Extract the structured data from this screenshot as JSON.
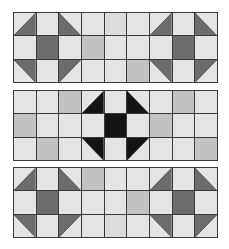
{
  "figure": {
    "colors": {
      "light": "#e4e4e4",
      "light_alt": "#dcdcdc",
      "medium": "#c2c2c2",
      "dark_gray": "#6c6c6c",
      "black": "#141414",
      "grid_line": "#3a3a3a"
    },
    "legend_codes": {
      "L": "light square",
      "A": "light square (alt tone)",
      "M": "medium gray square",
      "D": "solid dark fill",
      "TL": "half-square triangle, dark toward bottom-right",
      "TR": "half-square triangle, dark toward bottom-left",
      "BL": "half-square triangle, dark toward top-right",
      "BR": "half-square triangle, dark toward top-left"
    },
    "panels": [
      {
        "name": "panel-top",
        "top": 12,
        "dark": "#6c6c6c",
        "rows": [
          [
            "TL",
            "L",
            "TR",
            "L",
            "A",
            "L",
            "TL",
            "L",
            "TR"
          ],
          [
            "L",
            "D",
            "L",
            "M",
            "L",
            "L",
            "L",
            "D",
            "L"
          ],
          [
            "BL",
            "L",
            "BR",
            "L",
            "L",
            "M",
            "BL",
            "L",
            "BR"
          ]
        ]
      },
      {
        "name": "panel-middle",
        "top": 90,
        "dark": "#141414",
        "rows": [
          [
            "L",
            "L",
            "M",
            "TL",
            "L",
            "TR",
            "L",
            "M",
            "L"
          ],
          [
            "M",
            "L",
            "L",
            "L",
            "D",
            "L",
            "M",
            "L",
            "L"
          ],
          [
            "L",
            "M",
            "L",
            "BL",
            "L",
            "BR",
            "L",
            "L",
            "M"
          ]
        ]
      },
      {
        "name": "panel-bottom",
        "top": 167,
        "dark": "#6c6c6c",
        "rows": [
          [
            "TL",
            "L",
            "TR",
            "M",
            "L",
            "L",
            "TL",
            "L",
            "TR"
          ],
          [
            "L",
            "D",
            "L",
            "L",
            "L",
            "M",
            "L",
            "D",
            "L"
          ],
          [
            "BL",
            "L",
            "BR",
            "L",
            "A",
            "L",
            "BL",
            "L",
            "BR"
          ]
        ]
      }
    ]
  }
}
